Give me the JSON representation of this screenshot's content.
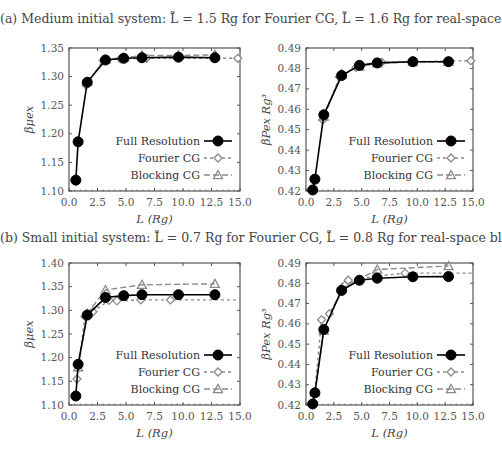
{
  "captions": {
    "a": "(a) Medium initial system: L̃ = 1.5 Rg for Fourier CG, L̃ = 1.6 Rg for real-space blocking.",
    "b": "(b) Small initial system: L̃ = 0.7 Rg for Fourier CG, L̃ = 0.8 Rg for real-space blocking."
  },
  "legend": [
    "Full Resolution",
    "Fourier CG",
    "Blocking CG"
  ],
  "colors": {
    "full": "#000000",
    "fourier": "#888888",
    "blocking": "#888888",
    "axis": "#555555"
  },
  "chart_data": [
    {
      "id": "a-left",
      "type": "line",
      "title": "",
      "xlabel": "L (Rg)",
      "ylabel": "βμex",
      "xlim": [
        0,
        15
      ],
      "ylim": [
        1.1,
        1.35
      ],
      "xticks": [
        "0.0",
        "2.5",
        "5.0",
        "7.5",
        "10.0",
        "12.5",
        "15.0"
      ],
      "yticks": [
        "1.10",
        "1.15",
        "1.20",
        "1.25",
        "1.30",
        "1.35"
      ],
      "legend_position": "lower right",
      "series": [
        {
          "name": "Full Resolution",
          "x": [
            0.6,
            0.8,
            1.6,
            3.2,
            4.8,
            6.4,
            9.6,
            12.8
          ],
          "y": [
            1.119,
            1.186,
            1.29,
            1.329,
            1.332,
            1.333,
            1.334,
            1.333
          ]
        },
        {
          "name": "Fourier CG",
          "x": [
            1.5,
            3.0,
            4.5,
            6.8,
            14.8
          ],
          "y": [
            1.285,
            1.328,
            1.331,
            1.332,
            1.332
          ],
          "extend_to": 15
        },
        {
          "name": "Blocking CG",
          "x": [
            1.6,
            3.2,
            4.8,
            6.4,
            9.6,
            12.8
          ],
          "y": [
            1.291,
            1.33,
            1.333,
            1.337,
            1.337,
            1.338
          ]
        }
      ]
    },
    {
      "id": "a-right",
      "type": "line",
      "title": "",
      "xlabel": "L (Rg)",
      "ylabel": "βPex Rg³",
      "xlim": [
        0,
        15
      ],
      "ylim": [
        0.42,
        0.49
      ],
      "xticks": [
        "0.0",
        "2.5",
        "5.0",
        "7.5",
        "10.0",
        "12.5",
        "15.0"
      ],
      "yticks": [
        "0.42",
        "0.43",
        "0.44",
        "0.45",
        "0.46",
        "0.47",
        "0.48",
        "0.49"
      ],
      "legend_position": "lower right",
      "series": [
        {
          "name": "Full Resolution",
          "x": [
            0.6,
            0.8,
            1.6,
            3.2,
            4.8,
            6.4,
            9.6,
            12.8
          ],
          "y": [
            0.4205,
            0.4258,
            0.4573,
            0.4765,
            0.4815,
            0.4827,
            0.4833,
            0.4833
          ]
        },
        {
          "name": "Fourier CG",
          "x": [
            1.5,
            3.0,
            4.5,
            6.8,
            14.8
          ],
          "y": [
            0.4548,
            0.4758,
            0.4805,
            0.483,
            0.4838
          ],
          "extend_to": 15
        },
        {
          "name": "Blocking CG",
          "x": [
            1.6,
            3.2,
            4.8,
            6.4,
            9.6,
            12.8
          ],
          "y": [
            0.4565,
            0.4772,
            0.481,
            0.4825,
            0.4832,
            0.4833
          ]
        }
      ]
    },
    {
      "id": "b-left",
      "type": "line",
      "title": "",
      "xlabel": "L (Rg)",
      "ylabel": "βμex",
      "xlim": [
        0,
        15
      ],
      "ylim": [
        1.1,
        1.4
      ],
      "xticks": [
        "0.0",
        "2.5",
        "5.0",
        "7.5",
        "10.0",
        "12.5",
        "15.0"
      ],
      "yticks": [
        "1.10",
        "1.15",
        "1.20",
        "1.25",
        "1.30",
        "1.35",
        "1.40"
      ],
      "legend_position": "lower right",
      "series": [
        {
          "name": "Full Resolution",
          "x": [
            0.6,
            0.8,
            1.6,
            3.2,
            4.8,
            6.4,
            9.6,
            12.8
          ],
          "y": [
            1.119,
            1.186,
            1.29,
            1.327,
            1.331,
            1.333,
            1.333,
            1.333
          ]
        },
        {
          "name": "Fourier CG",
          "x": [
            0.7,
            1.4,
            2.1,
            3.5,
            4.2,
            6.3,
            8.9
          ],
          "y": [
            1.155,
            1.287,
            1.297,
            1.321,
            1.32,
            1.322,
            1.322
          ],
          "extend_to": 15
        },
        {
          "name": "Blocking CG",
          "x": [
            0.8,
            1.6,
            3.2,
            6.4,
            12.8
          ],
          "y": [
            1.18,
            1.293,
            1.343,
            1.354,
            1.356
          ]
        }
      ]
    },
    {
      "id": "b-right",
      "type": "line",
      "title": "",
      "xlabel": "L (Rg)",
      "ylabel": "βPex Rg³",
      "xlim": [
        0,
        15
      ],
      "ylim": [
        0.42,
        0.49
      ],
      "xticks": [
        "0.0",
        "2.5",
        "5.0",
        "7.5",
        "10.0",
        "12.5",
        "15.0"
      ],
      "yticks": [
        "0.42",
        "0.43",
        "0.44",
        "0.45",
        "0.46",
        "0.47",
        "0.48",
        "0.49"
      ],
      "legend_position": "lower right",
      "series": [
        {
          "name": "Full Resolution",
          "x": [
            0.6,
            0.8,
            1.6,
            3.2,
            4.8,
            6.4,
            9.6,
            12.8
          ],
          "y": [
            0.4205,
            0.426,
            0.4572,
            0.4765,
            0.4815,
            0.4825,
            0.4832,
            0.4833
          ]
        },
        {
          "name": "Fourier CG",
          "x": [
            0.7,
            1.4,
            2.1,
            3.5,
            3.8,
            6.3,
            8.9
          ],
          "y": [
            0.4213,
            0.462,
            0.465,
            0.479,
            0.4815,
            0.4835,
            0.485
          ],
          "extend_to": 15
        },
        {
          "name": "Blocking CG",
          "x": [
            0.8,
            1.6,
            3.2,
            6.4,
            12.8
          ],
          "y": [
            0.4262,
            0.4567,
            0.4775,
            0.4868,
            0.4885
          ]
        }
      ]
    }
  ],
  "panels": [
    {
      "left": 69,
      "top": 48,
      "width": 171,
      "height": 143
    },
    {
      "left": 306,
      "top": 48,
      "width": 167,
      "height": 143
    },
    {
      "left": 69,
      "top": 263,
      "width": 171,
      "height": 142
    },
    {
      "left": 306,
      "top": 263,
      "width": 167,
      "height": 142
    }
  ]
}
